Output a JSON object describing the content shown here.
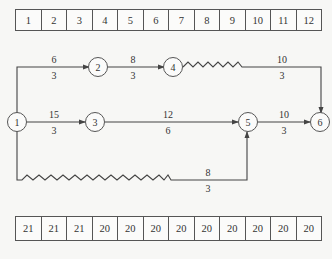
{
  "top_table": {
    "cells": [
      "1",
      "2",
      "3",
      "4",
      "5",
      "6",
      "7",
      "8",
      "9",
      "10",
      "11",
      "12"
    ]
  },
  "bottom_table": {
    "cells": [
      "21",
      "21",
      "21",
      "20",
      "20",
      "20",
      "20",
      "20",
      "20",
      "20",
      "20",
      "20"
    ]
  },
  "nodes": [
    {
      "id": "1",
      "label": "1"
    },
    {
      "id": "2",
      "label": "2"
    },
    {
      "id": "3",
      "label": "3"
    },
    {
      "id": "4",
      "label": "4"
    },
    {
      "id": "5",
      "label": "5"
    },
    {
      "id": "6",
      "label": "6"
    }
  ],
  "edges": [
    {
      "from": "1",
      "to": "2",
      "duration": "6",
      "resource": "3"
    },
    {
      "from": "2",
      "to": "4",
      "duration": "8",
      "resource": "3"
    },
    {
      "from": "4",
      "to": "6",
      "duration": "10",
      "resource": "3",
      "free_float": "wavy"
    },
    {
      "from": "1",
      "to": "3",
      "duration": "15",
      "resource": "3"
    },
    {
      "from": "3",
      "to": "5",
      "duration": "12",
      "resource": "6"
    },
    {
      "from": "5",
      "to": "6",
      "duration": "10",
      "resource": "3"
    },
    {
      "from": "1",
      "to": "5",
      "duration": "8",
      "resource": "3",
      "free_float": "wavy"
    }
  ],
  "colors": {
    "line": "#444444",
    "background": "#f7f7f5"
  }
}
